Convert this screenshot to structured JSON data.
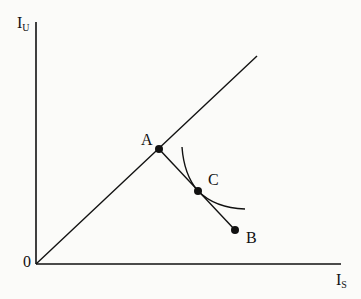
{
  "diagram": {
    "type": "utility-possibility",
    "axes": {
      "y_label": {
        "main": "I",
        "sub": "U"
      },
      "x_label": {
        "main": "I",
        "sub": "S"
      },
      "origin_label": "0"
    },
    "points": [
      {
        "id": "A",
        "label": "A",
        "x": 159,
        "y": 149
      },
      {
        "id": "C",
        "label": "C",
        "x": 198,
        "y": 191
      },
      {
        "id": "B",
        "label": "B",
        "x": 235,
        "y": 230
      }
    ],
    "lines": [
      {
        "id": "forty-five-degree-line",
        "from": [
          36,
          264
        ],
        "to": [
          257,
          56
        ]
      },
      {
        "id": "segment-A-B",
        "from": [
          159,
          149
        ],
        "to": [
          235,
          230
        ]
      }
    ],
    "curve": {
      "id": "indifference-curve",
      "start": [
        182,
        147
      ],
      "tangent_at": "C",
      "end": [
        245,
        209
      ]
    },
    "colors": {
      "ink": "#111111",
      "paper": "#fbfbf9"
    }
  }
}
